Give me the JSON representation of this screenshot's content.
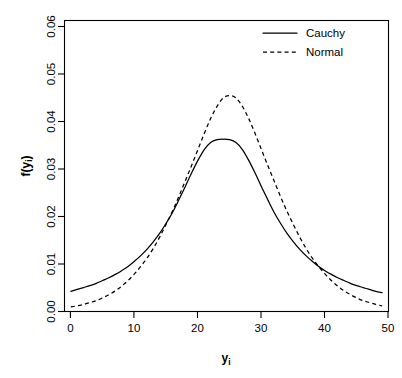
{
  "chart_data": {
    "type": "line",
    "title": "",
    "xlabel": "y",
    "xlabel_sub": "i",
    "ylabel": "f(y",
    "ylabel_sub": "i",
    "ylabel_close": ")",
    "xlim": [
      0,
      51
    ],
    "ylim": [
      0.0,
      0.062
    ],
    "xticks": [
      0,
      10,
      20,
      30,
      40,
      50
    ],
    "xtick_labels": [
      "0",
      "10",
      "20",
      "30",
      "40",
      "50"
    ],
    "yticks": [
      0.0,
      0.01,
      0.02,
      0.03,
      0.04,
      0.05,
      0.06
    ],
    "ytick_labels": [
      "0.00",
      "0.01",
      "0.02",
      "0.03",
      "0.04",
      "0.05",
      "0.06"
    ],
    "grid": false,
    "legend_position": "top-right",
    "x": [
      1,
      2,
      3,
      4,
      5,
      6,
      7,
      8,
      9,
      10,
      11,
      12,
      13,
      14,
      15,
      16,
      17,
      18,
      19,
      20,
      21,
      22,
      23,
      24,
      25,
      26,
      27,
      28,
      29,
      30,
      31,
      32,
      33,
      34,
      35,
      36,
      37,
      38,
      39,
      40,
      41,
      42,
      43,
      44,
      45,
      46,
      47,
      48,
      49,
      50
    ],
    "series": [
      {
        "name": "Cauchy",
        "style": "solid",
        "color": "#000000",
        "peak_x": 25,
        "peak_y": 0.0367,
        "values": [
          0.0043,
          0.0047,
          0.0051,
          0.0055,
          0.006,
          0.0066,
          0.0072,
          0.0079,
          0.0087,
          0.0096,
          0.0107,
          0.0119,
          0.0133,
          0.0149,
          0.0167,
          0.0188,
          0.0211,
          0.0238,
          0.0266,
          0.0295,
          0.0322,
          0.0345,
          0.036,
          0.0366,
          0.0367,
          0.0366,
          0.036,
          0.0345,
          0.0322,
          0.0295,
          0.0266,
          0.0238,
          0.0211,
          0.0188,
          0.0167,
          0.0149,
          0.0133,
          0.0119,
          0.0107,
          0.0096,
          0.0087,
          0.0079,
          0.0072,
          0.0066,
          0.006,
          0.0055,
          0.0051,
          0.0047,
          0.0043,
          0.004
        ]
      },
      {
        "name": "Normal",
        "style": "dashed",
        "color": "#000000",
        "peak_x": 25,
        "peak_y": 0.046,
        "values": [
          0.001,
          0.0012,
          0.0015,
          0.0019,
          0.0023,
          0.0029,
          0.0036,
          0.0044,
          0.0054,
          0.0066,
          0.008,
          0.0096,
          0.0114,
          0.0135,
          0.0159,
          0.0186,
          0.0214,
          0.0245,
          0.0278,
          0.0311,
          0.0345,
          0.0379,
          0.0411,
          0.0437,
          0.0455,
          0.046,
          0.0455,
          0.0437,
          0.0411,
          0.0379,
          0.0345,
          0.0311,
          0.0278,
          0.0245,
          0.0214,
          0.0186,
          0.0159,
          0.0135,
          0.0114,
          0.0096,
          0.008,
          0.0066,
          0.0054,
          0.0044,
          0.0036,
          0.0029,
          0.0023,
          0.0019,
          0.0015,
          0.0012
        ]
      }
    ],
    "legend": [
      {
        "label": "Cauchy",
        "style": "solid"
      },
      {
        "label": "Normal",
        "style": "dashed"
      }
    ],
    "annotations": {
      "crossings": [
        9.5,
        41.0
      ]
    }
  }
}
